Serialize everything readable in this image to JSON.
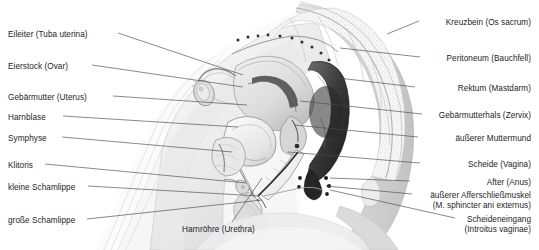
{
  "figure": {
    "type": "anatomical-illustration",
    "style": "grayscale-sagittal-section",
    "background_color": "#ffffff",
    "leader_line_color": "#4a4a4a",
    "text_color": "#1d1d1d"
  },
  "labels_left": [
    {
      "id": "eileiter",
      "text": "Eileiter (Tuba uterina)",
      "text_x": 8,
      "text_y": 36,
      "line_from_x": 118,
      "line_from_y": 33,
      "line_to_x": 243,
      "line_to_y": 75
    },
    {
      "id": "eierstock",
      "text": "Eierstock (Ovar)",
      "text_x": 8,
      "text_y": 68,
      "line_from_x": 92,
      "line_from_y": 65,
      "line_to_x": 243,
      "line_to_y": 87
    },
    {
      "id": "gebaermutter",
      "text": "Gebärmutter (Uterus)",
      "text_x": 8,
      "text_y": 99,
      "line_from_x": 113,
      "line_from_y": 96,
      "line_to_x": 247,
      "line_to_y": 105
    },
    {
      "id": "harnblase",
      "text": "Harnblase",
      "text_x": 8,
      "text_y": 119,
      "line_from_x": 63,
      "line_from_y": 116,
      "line_to_x": 238,
      "line_to_y": 127
    },
    {
      "id": "symphyse",
      "text": "Symphyse",
      "text_x": 8,
      "text_y": 140,
      "line_from_x": 62,
      "line_from_y": 137,
      "line_to_x": 232,
      "line_to_y": 152
    },
    {
      "id": "klitoris",
      "text": "Klitoris",
      "text_x": 8,
      "text_y": 167,
      "line_from_x": 45,
      "line_from_y": 164,
      "line_to_x": 246,
      "line_to_y": 183
    },
    {
      "id": "kleine-schamlippe",
      "text": "kleine Schamlippe",
      "text_x": 8,
      "text_y": 189,
      "line_from_x": 88,
      "line_from_y": 186,
      "line_to_x": 258,
      "line_to_y": 196
    },
    {
      "id": "grosse-schamlippe",
      "text": "große  Schamlippe",
      "text_x": 8,
      "text_y": 222,
      "line_from_x": 87,
      "line_from_y": 219,
      "line_to_x": 262,
      "line_to_y": 200
    }
  ],
  "labels_right": [
    {
      "id": "kreuzbein",
      "text": "Kreuzbein (Os sacrum)",
      "text_x": 531,
      "text_y": 24,
      "line_from_x": 419,
      "line_from_y": 21,
      "line_to_x": 387,
      "line_to_y": 34
    },
    {
      "id": "peritoneum",
      "text": "Peritoneum (Bauchfell)",
      "text_x": 531,
      "text_y": 60,
      "line_from_x": 420,
      "line_from_y": 57,
      "line_to_x": 340,
      "line_to_y": 48
    },
    {
      "id": "rektum",
      "text": "Rektum (Mastdarm)",
      "text_x": 531,
      "text_y": 90,
      "line_from_x": 415,
      "line_from_y": 87,
      "line_to_x": 330,
      "line_to_y": 77
    },
    {
      "id": "gebaermutterhals",
      "text": "Gebärmutterhals (Zervix)",
      "text_x": 531,
      "text_y": 117,
      "line_from_x": 422,
      "line_from_y": 114,
      "line_to_x": 300,
      "line_to_y": 101
    },
    {
      "id": "aeusserer-muttermund",
      "text": "äußerer Muttermund",
      "text_x": 531,
      "text_y": 140,
      "line_from_x": 418,
      "line_from_y": 137,
      "line_to_x": 294,
      "line_to_y": 125
    },
    {
      "id": "scheide",
      "text": "Scheide (Vagina)",
      "text_x": 531,
      "text_y": 166,
      "line_from_x": 420,
      "line_from_y": 163,
      "line_to_x": 288,
      "line_to_y": 152
    },
    {
      "id": "after",
      "text": "After (Anus)",
      "text_x": 531,
      "text_y": 184,
      "line_from_x": 410,
      "line_from_y": 181,
      "line_to_x": 330,
      "line_to_y": 178
    },
    {
      "id": "sphinkter-1",
      "text": "äußerer Afferschließmuskel",
      "text_x": 531,
      "text_y": 197,
      "line_from_x": 412,
      "line_from_y": 194,
      "line_to_x": 326,
      "line_to_y": 186
    },
    {
      "id": "sphinkter-2",
      "text": "(M. sphincter ani externus)",
      "text_x": 531,
      "text_y": 207,
      "line_from_x": null,
      "line_from_y": null,
      "line_to_x": null,
      "line_to_y": null
    },
    {
      "id": "scheideneingang-1",
      "text": "Scheideneingang",
      "text_x": 531,
      "text_y": 221,
      "line_from_x": 455,
      "line_from_y": 218,
      "line_to_x": 330,
      "line_to_y": 190
    },
    {
      "id": "scheideneingang-2",
      "text": "(Introitus vaginae)",
      "text_x": 531,
      "text_y": 231,
      "line_from_x": null,
      "line_from_y": null,
      "line_to_x": null,
      "line_to_y": null
    }
  ],
  "labels_bottom": [
    {
      "id": "harnroehre",
      "text": "Harnröhre (Urethra)",
      "text_x": 182,
      "text_y": 231,
      "line_from_x": 232,
      "line_from_y": 222,
      "line_to_x": 262,
      "line_to_y": 178
    }
  ],
  "bottom_cut_text": ""
}
